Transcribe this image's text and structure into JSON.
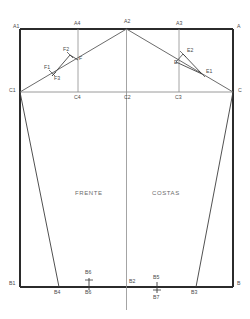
{
  "drawing": {
    "title": "Molde base - Frente e Costas",
    "regions": [
      {
        "name": "front",
        "label": "FRENTE",
        "x": 75,
        "y": 190
      },
      {
        "name": "back",
        "label": "COSTAS",
        "x": 152,
        "y": 190
      }
    ],
    "points": [
      {
        "id": "A1",
        "label": "A1",
        "x": 13,
        "y": 24
      },
      {
        "id": "A4",
        "label": "A4",
        "x": 76,
        "y": 22
      },
      {
        "id": "A2",
        "label": "A2",
        "x": 128,
        "y": 20
      },
      {
        "id": "A3",
        "label": "A3",
        "x": 179,
        "y": 22
      },
      {
        "id": "A",
        "label": "A",
        "x": 238,
        "y": 24
      },
      {
        "id": "C1",
        "label": "C1",
        "x": 10,
        "y": 90
      },
      {
        "id": "C4",
        "label": "C4",
        "x": 76,
        "y": 96
      },
      {
        "id": "C2",
        "label": "C2",
        "x": 128,
        "y": 96
      },
      {
        "id": "C3",
        "label": "C3",
        "x": 178,
        "y": 96
      },
      {
        "id": "C",
        "label": "C",
        "x": 240,
        "y": 90
      },
      {
        "id": "F1",
        "label": "F1",
        "x": 46,
        "y": 67
      },
      {
        "id": "F2",
        "label": "F2",
        "x": 66,
        "y": 52
      },
      {
        "id": "F3",
        "label": "F3",
        "x": 54,
        "y": 79
      },
      {
        "id": "F",
        "label": "F",
        "x": 80,
        "y": 60
      },
      {
        "id": "E2",
        "label": "E2",
        "x": 188,
        "y": 50
      },
      {
        "id": "E",
        "label": "E",
        "x": 176,
        "y": 63
      },
      {
        "id": "E1",
        "label": "E1",
        "x": 209,
        "y": 72
      },
      {
        "id": "B1",
        "label": "B1",
        "x": 10,
        "y": 283
      },
      {
        "id": "B4",
        "label": "B4",
        "x": 55,
        "y": 291
      },
      {
        "id": "B6t",
        "label": "B6",
        "x": 86,
        "y": 272
      },
      {
        "id": "B6b",
        "label": "B6",
        "x": 86,
        "y": 291
      },
      {
        "id": "B2",
        "label": "B2",
        "x": 130,
        "y": 280
      },
      {
        "id": "B5",
        "label": "B5",
        "x": 155,
        "y": 276
      },
      {
        "id": "B7",
        "label": "B7",
        "x": 155,
        "y": 295
      },
      {
        "id": "B3",
        "label": "B3",
        "x": 192,
        "y": 291
      },
      {
        "id": "B",
        "label": "B",
        "x": 238,
        "y": 283
      }
    ],
    "colors": {
      "frame": "#2b2b2b",
      "construction": "#555555",
      "guide": "#9a9a9a",
      "label": "#4a4a4a",
      "background": "#ffffff"
    }
  }
}
